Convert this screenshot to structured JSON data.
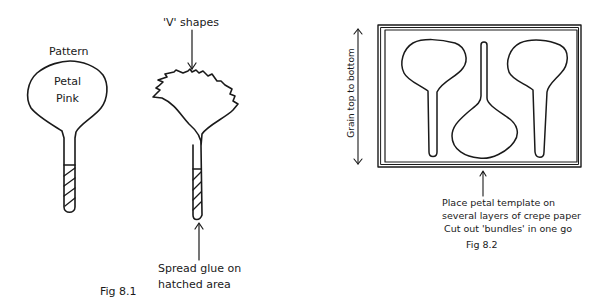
{
  "figures": [
    {
      "id": "fig-8-1",
      "caption": "Fig 8.1",
      "pattern_label": "Pattern",
      "petal_text_line1": "Petal",
      "petal_text_line2": "Pink",
      "v_shapes_label": "'V' shapes",
      "glue_label_line1": "Spread glue on",
      "glue_label_line2": "hatched area"
    },
    {
      "id": "fig-8-2",
      "caption": "Fig 8.2",
      "grain_label": "Grain top to bottom",
      "instruction_line1": "Place petal template on",
      "instruction_line2": "several layers of crepe paper",
      "instruction_line3": "Cut out 'bundles' in one go"
    }
  ],
  "colors": {
    "ink": "#1a1a1a",
    "background": "#ffffff"
  }
}
